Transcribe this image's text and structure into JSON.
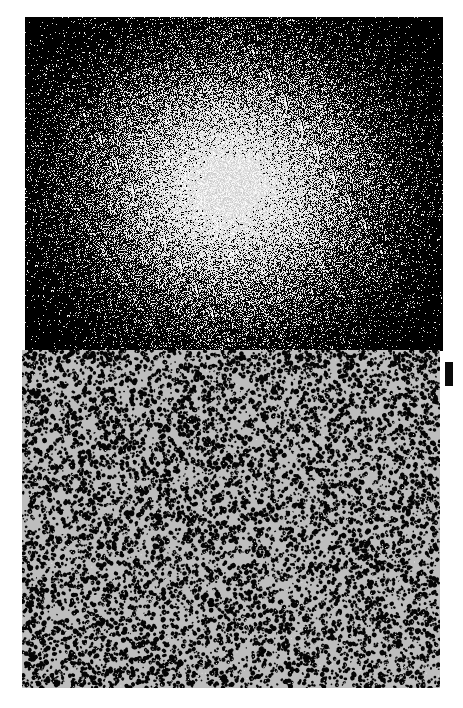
{
  "figure": {
    "panels": [
      {
        "id": "top",
        "description": "Noisy radial Gaussian intensity blob, bright center fading to black",
        "background": "#000000",
        "glow": "#ffffff"
      },
      {
        "id": "bottom",
        "description": "Random black speckle texture on light gray",
        "background": "#bdbdbd",
        "speckle": "#000000"
      }
    ],
    "marker": {
      "color": "#0a0a0a"
    }
  }
}
